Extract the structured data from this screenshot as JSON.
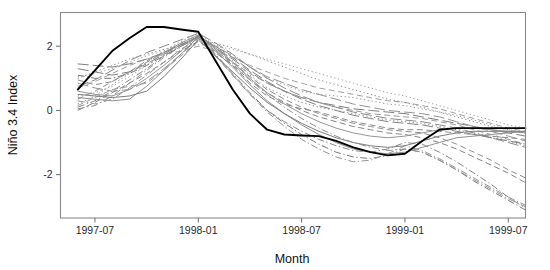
{
  "chart_data": {
    "type": "line",
    "title": "",
    "subtitle": "",
    "xlabel": "Month",
    "ylabel": "Niño 3.4 Index",
    "grid": false,
    "legend": "none",
    "x_tick_labels": [
      "1997-07",
      "1998-01",
      "1998-07",
      "1999-01",
      "1999-07"
    ],
    "x_tick_values": [
      6,
      12,
      18,
      24,
      30
    ],
    "y_tick_labels": [
      "2",
      "0",
      "-2"
    ],
    "y_tick_values": [
      2,
      0,
      -2
    ],
    "xlim": [
      4,
      31
    ],
    "ylim": [
      -3.35,
      3.05
    ],
    "x_unit": "months since 1997-01",
    "x": [
      5,
      6,
      7,
      8,
      9,
      10,
      11,
      12,
      13,
      14,
      15,
      16,
      17,
      18,
      19,
      20,
      21,
      22,
      23,
      24,
      25,
      26,
      27,
      28,
      29,
      30,
      31
    ],
    "series": [
      {
        "name": "observed",
        "style": "solid",
        "color": "#000000",
        "width": 1.9,
        "emphasis": true,
        "values": [
          0.65,
          1.25,
          1.85,
          2.25,
          2.6,
          2.6,
          2.52,
          2.45,
          1.55,
          0.65,
          -0.1,
          -0.6,
          -0.75,
          -0.78,
          -0.8,
          -0.95,
          -1.15,
          -1.3,
          -1.4,
          -1.35,
          -0.95,
          -0.6,
          -0.55,
          -0.55,
          -0.55,
          -0.55,
          -0.55
        ]
      },
      {
        "name": "member-01",
        "style": "dashed",
        "color": "#8c8c8c",
        "width": 1.0,
        "emphasis": false,
        "values": [
          0.95,
          0.8,
          0.9,
          1.2,
          1.55,
          1.8,
          2.1,
          2.35,
          1.9,
          1.4,
          0.85,
          0.45,
          0.2,
          0.05,
          -0.05,
          -0.2,
          -0.35,
          -0.45,
          -0.55,
          -0.6,
          -0.6,
          -0.65,
          -0.7,
          -0.75,
          -0.8,
          -0.85,
          -0.9
        ]
      },
      {
        "name": "member-02",
        "style": "dotted",
        "color": "#9a9a9a",
        "width": 1.0,
        "emphasis": false,
        "values": [
          0.45,
          0.55,
          0.75,
          1.05,
          1.4,
          1.75,
          2.05,
          2.3,
          2.05,
          1.75,
          1.35,
          1.0,
          0.8,
          0.6,
          0.5,
          0.45,
          0.4,
          0.3,
          0.2,
          0.15,
          0.05,
          -0.05,
          -0.15,
          -0.3,
          -0.45,
          -0.6,
          -0.7
        ]
      },
      {
        "name": "member-03",
        "style": "dashdot",
        "color": "#888888",
        "width": 1.0,
        "emphasis": false,
        "values": [
          0.1,
          0.3,
          0.6,
          0.95,
          1.3,
          1.7,
          2.0,
          2.25,
          1.7,
          1.1,
          0.5,
          0.0,
          -0.35,
          -0.65,
          -0.9,
          -1.1,
          -1.25,
          -1.3,
          -1.2,
          -1.0,
          -1.05,
          -1.3,
          -1.6,
          -1.95,
          -2.3,
          -2.7,
          -3.05
        ]
      },
      {
        "name": "member-04",
        "style": "longdash",
        "color": "#7e7e7e",
        "width": 1.0,
        "emphasis": false,
        "values": [
          1.45,
          1.4,
          1.35,
          1.45,
          1.6,
          1.8,
          2.05,
          2.3,
          1.95,
          1.6,
          1.2,
          0.85,
          0.6,
          0.4,
          0.25,
          0.15,
          0.05,
          0.0,
          -0.05,
          -0.1,
          -0.2,
          -0.3,
          -0.4,
          -0.5,
          -0.6,
          -0.7,
          -0.8
        ]
      },
      {
        "name": "member-05",
        "style": "solid",
        "color": "#909090",
        "width": 1.0,
        "emphasis": false,
        "values": [
          0.4,
          0.35,
          0.3,
          0.35,
          0.75,
          1.25,
          1.75,
          2.3,
          1.85,
          1.35,
          0.8,
          0.3,
          -0.1,
          -0.45,
          -0.75,
          -1.0,
          -1.2,
          -1.3,
          -1.35,
          -1.3,
          -1.15,
          -1.0,
          -0.85,
          -0.8,
          -0.75,
          -0.7,
          -0.65
        ]
      },
      {
        "name": "member-06",
        "style": "dashed",
        "color": "#a0a0a0",
        "width": 1.0,
        "emphasis": false,
        "values": [
          0.7,
          0.9,
          1.15,
          1.4,
          1.6,
          1.75,
          1.85,
          2.0,
          1.85,
          1.65,
          1.4,
          1.2,
          1.0,
          0.85,
          0.7,
          0.6,
          0.5,
          0.4,
          0.3,
          0.25,
          0.15,
          0.05,
          -0.1,
          -0.25,
          -0.4,
          -0.55,
          -0.65
        ]
      },
      {
        "name": "member-07",
        "style": "dotted",
        "color": "#8f8f8f",
        "width": 1.0,
        "emphasis": false,
        "values": [
          0.2,
          0.45,
          0.8,
          1.15,
          1.5,
          1.85,
          2.15,
          2.4,
          2.0,
          1.55,
          1.1,
          0.7,
          0.45,
          0.25,
          0.1,
          0.0,
          -0.1,
          -0.2,
          -0.3,
          -0.35,
          -0.4,
          -0.5,
          -0.6,
          -0.7,
          -0.8,
          -0.95,
          -1.1
        ]
      },
      {
        "name": "member-08",
        "style": "dashdot",
        "color": "#7a7a7a",
        "width": 1.0,
        "emphasis": false,
        "values": [
          1.1,
          1.0,
          1.0,
          1.15,
          1.4,
          1.7,
          2.0,
          2.3,
          1.75,
          1.15,
          0.55,
          0.0,
          -0.4,
          -0.75,
          -1.05,
          -1.3,
          -1.45,
          -1.5,
          -1.4,
          -1.2,
          -1.3,
          -1.55,
          -1.85,
          -2.2,
          -2.5,
          -2.8,
          -3.1
        ]
      },
      {
        "name": "member-09",
        "style": "longdash",
        "color": "#949494",
        "width": 1.0,
        "emphasis": false,
        "values": [
          0.85,
          0.7,
          0.6,
          0.65,
          0.9,
          1.3,
          1.75,
          2.25,
          2.0,
          1.7,
          1.35,
          1.05,
          0.85,
          0.65,
          0.5,
          0.35,
          0.2,
          0.1,
          0.0,
          -0.05,
          -0.1,
          -0.2,
          -0.35,
          -0.5,
          -0.65,
          -0.8,
          -0.95
        ]
      },
      {
        "name": "member-10",
        "style": "dashed",
        "color": "#858585",
        "width": 1.0,
        "emphasis": false,
        "values": [
          0.0,
          0.25,
          0.55,
          0.85,
          1.15,
          1.5,
          1.85,
          2.15,
          1.8,
          1.4,
          0.95,
          0.55,
          0.25,
          0.0,
          -0.2,
          -0.35,
          -0.5,
          -0.6,
          -0.7,
          -0.75,
          -0.85,
          -1.0,
          -1.2,
          -1.45,
          -1.7,
          -1.95,
          -2.25
        ]
      },
      {
        "name": "member-11",
        "style": "solid",
        "color": "#989898",
        "width": 1.0,
        "emphasis": false,
        "values": [
          0.6,
          0.5,
          0.45,
          0.65,
          1.0,
          1.4,
          1.85,
          2.35,
          1.95,
          1.5,
          1.0,
          0.55,
          0.2,
          -0.1,
          -0.35,
          -0.55,
          -0.7,
          -0.8,
          -0.85,
          -0.8,
          -0.7,
          -0.6,
          -0.55,
          -0.55,
          -0.6,
          -0.65,
          -0.7
        ]
      },
      {
        "name": "member-12",
        "style": "dotted",
        "color": "#8b8b8b",
        "width": 1.0,
        "emphasis": false,
        "values": [
          1.0,
          1.2,
          1.4,
          1.6,
          1.75,
          1.9,
          2.05,
          2.2,
          2.1,
          1.95,
          1.75,
          1.55,
          1.35,
          1.15,
          0.95,
          0.8,
          0.65,
          0.5,
          0.35,
          0.25,
          0.1,
          -0.05,
          -0.2,
          -0.35,
          -0.5,
          -0.6,
          -0.7
        ]
      },
      {
        "name": "member-13",
        "style": "dashdot",
        "color": "#959595",
        "width": 1.0,
        "emphasis": false,
        "values": [
          0.3,
          0.2,
          0.35,
          0.7,
          1.1,
          1.5,
          1.9,
          2.25,
          1.7,
          1.1,
          0.5,
          -0.05,
          -0.5,
          -0.9,
          -1.2,
          -1.45,
          -1.6,
          -1.55,
          -1.35,
          -1.1,
          -1.25,
          -1.5,
          -1.8,
          -2.1,
          -2.4,
          -2.7,
          -2.95
        ]
      },
      {
        "name": "member-14",
        "style": "longdash",
        "color": "#8a8a8a",
        "width": 1.0,
        "emphasis": false,
        "values": [
          0.75,
          0.95,
          1.25,
          1.55,
          1.8,
          2.0,
          2.2,
          2.4,
          2.1,
          1.75,
          1.35,
          1.0,
          0.7,
          0.45,
          0.25,
          0.1,
          -0.05,
          -0.15,
          -0.25,
          -0.3,
          -0.35,
          -0.45,
          -0.55,
          -0.7,
          -0.85,
          -1.0,
          -1.15
        ]
      },
      {
        "name": "member-15",
        "style": "dashed",
        "color": "#9c9c9c",
        "width": 1.0,
        "emphasis": false,
        "values": [
          0.15,
          0.4,
          0.65,
          0.75,
          0.85,
          1.25,
          1.7,
          2.15,
          1.85,
          1.5,
          1.15,
          0.85,
          0.6,
          0.4,
          0.25,
          0.1,
          0.0,
          -0.1,
          -0.15,
          -0.2,
          -0.25,
          -0.35,
          -0.45,
          -0.6,
          -0.75,
          -0.9,
          -1.05
        ]
      },
      {
        "name": "member-16",
        "style": "solid",
        "color": "#7d7d7d",
        "width": 1.0,
        "emphasis": false,
        "values": [
          0.5,
          0.45,
          0.4,
          0.45,
          0.6,
          1.05,
          1.6,
          2.2,
          1.7,
          1.2,
          0.7,
          0.25,
          -0.1,
          -0.4,
          -0.65,
          -0.85,
          -1.0,
          -1.1,
          -1.15,
          -1.1,
          -0.95,
          -0.8,
          -0.7,
          -0.65,
          -0.65,
          -0.65,
          -0.65
        ]
      },
      {
        "name": "member-17",
        "style": "dotted",
        "color": "#a2a2a2",
        "width": 1.0,
        "emphasis": false,
        "values": [
          1.05,
          1.15,
          1.3,
          1.5,
          1.7,
          1.85,
          1.95,
          2.05,
          2.0,
          1.9,
          1.75,
          1.6,
          1.45,
          1.3,
          1.15,
          1.0,
          0.85,
          0.7,
          0.55,
          0.45,
          0.3,
          0.15,
          0.0,
          -0.15,
          -0.3,
          -0.45,
          -0.55
        ]
      },
      {
        "name": "member-18",
        "style": "dashdot",
        "color": "#919191",
        "width": 1.0,
        "emphasis": false,
        "values": [
          0.05,
          0.15,
          0.45,
          0.85,
          1.25,
          1.65,
          2.0,
          2.3,
          1.9,
          1.45,
          0.95,
          0.5,
          0.1,
          -0.25,
          -0.55,
          -0.8,
          -1.0,
          -1.15,
          -1.25,
          -1.2,
          -1.3,
          -1.55,
          -1.85,
          -2.15,
          -2.45,
          -2.75,
          -3.0
        ]
      },
      {
        "name": "member-19",
        "style": "longdash",
        "color": "#838383",
        "width": 1.0,
        "emphasis": false,
        "values": [
          1.3,
          1.2,
          1.1,
          1.2,
          1.45,
          1.75,
          2.05,
          2.3,
          2.0,
          1.65,
          1.25,
          0.9,
          0.6,
          0.35,
          0.15,
          0.0,
          -0.15,
          -0.25,
          -0.35,
          -0.4,
          -0.45,
          -0.55,
          -0.65,
          -0.75,
          -0.85,
          -0.95,
          -1.05
        ]
      },
      {
        "name": "member-20",
        "style": "dashed",
        "color": "#8e8e8e",
        "width": 1.0,
        "emphasis": false,
        "values": [
          0.35,
          0.6,
          0.9,
          1.2,
          1.5,
          1.8,
          2.1,
          2.35,
          1.95,
          1.5,
          1.05,
          0.65,
          0.35,
          0.1,
          -0.1,
          -0.25,
          -0.4,
          -0.5,
          -0.6,
          -0.65,
          -0.7,
          -0.85,
          -1.05,
          -1.3,
          -1.55,
          -1.85,
          -2.1
        ]
      }
    ]
  }
}
